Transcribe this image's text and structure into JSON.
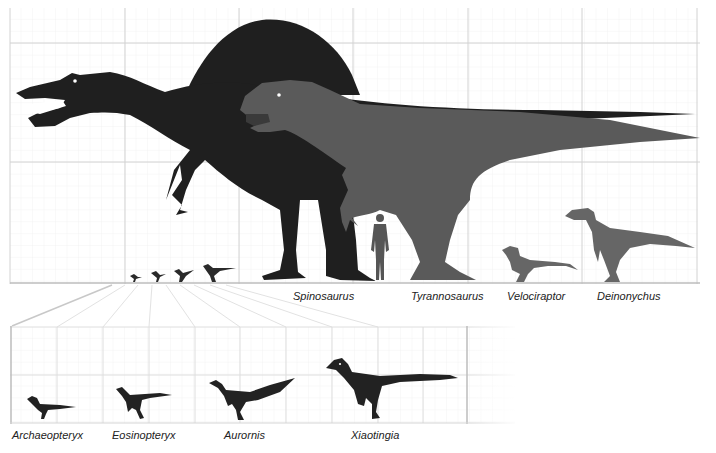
{
  "diagram": {
    "type": "size-comparison",
    "colors": {
      "spinosaurus": "#1f1f1f",
      "tyrannosaurus": "#5a5a5a",
      "human": "#555555",
      "velociraptor": "#666666",
      "deinonychus": "#666666",
      "small_theropods": "#2a2a2a",
      "grid_major": "#cfcfcf",
      "grid_minor": "#ececec",
      "baseline": "#bdbdbd"
    },
    "top_panel": {
      "labels": {
        "spinosaurus": "Spinosaurus",
        "tyrannosaurus": "Tyrannosaurus",
        "velociraptor": "Velociraptor",
        "deinonychus": "Deinonychus"
      }
    },
    "inset_panel": {
      "labels": {
        "archaeopteryx": "Archaeopteryx",
        "eosinopteryx": "Eosinopteryx",
        "aurornis": "Aurornis",
        "xiaotingia": "Xiaotingia"
      }
    }
  }
}
